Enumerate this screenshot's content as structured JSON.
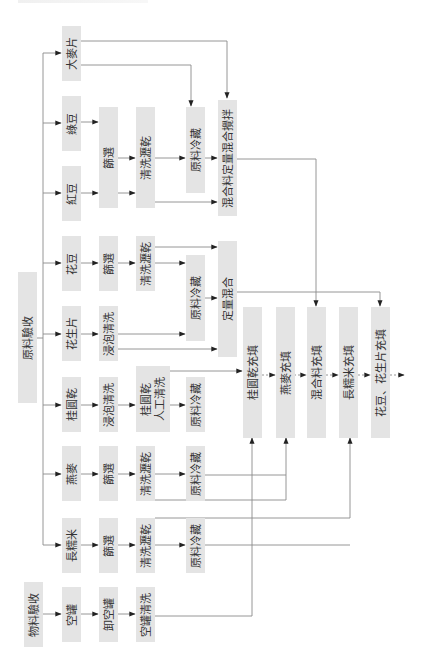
{
  "diagram": {
    "type": "process-flowchart",
    "orientation": "rotated-90-ccw",
    "colors": {
      "box_fill": "#e4e4e4",
      "line": "#8a8a8a",
      "arrow": "#222222",
      "text": "#333333"
    },
    "nodes": {
      "raw_inspection": "原料驗收",
      "barley_flakes": "大麥片",
      "mung_bean": "綠豆",
      "red_bean": "紅豆",
      "flower_bean": "花豆",
      "peanut_slices": "花生片",
      "dried_longan": "桂圓乾",
      "oats": "燕麥",
      "long_glutinous_rice": "長糯米",
      "empty_can": "空罐",
      "material_inspection": "物料驗收",
      "screening_beans": "篩選",
      "screening_flower_bean": "篩選",
      "soak_wash_peanut": "浸泡清洗",
      "soak_wash_longan": "浸泡清洗",
      "screening_oats": "篩選",
      "screening_rice": "篩選",
      "unload_cans": "卸空罐",
      "wash_drain_beans": "清洗瀝乾",
      "wash_drain_flower_bean": "清洗瀝乾",
      "longan_manual_wash_l1": "桂圓乾",
      "longan_manual_wash_l2": "人工清洗",
      "wash_drain_oats": "清洗瀝乾",
      "wash_drain_rice": "清洗瀝乾",
      "can_washing": "空罐清洗",
      "cold_storage_beans": "原料冷藏",
      "cold_storage_flower_peanut": "原料冷藏",
      "cold_storage_longan": "原料冷藏",
      "cold_storage_oats": "原料冷藏",
      "cold_storage_rice": "原料冷藏",
      "mix_quantitative_stir": "混合料定量混合攪拌",
      "quantitative_mix": "定量混合",
      "fill_longan": "桂圓乾充填",
      "fill_oats": "燕麥充填",
      "fill_mix": "混合料充填",
      "fill_rice": "長糯米充填",
      "fill_bean_peanut": "花豆、花生片充填"
    }
  }
}
